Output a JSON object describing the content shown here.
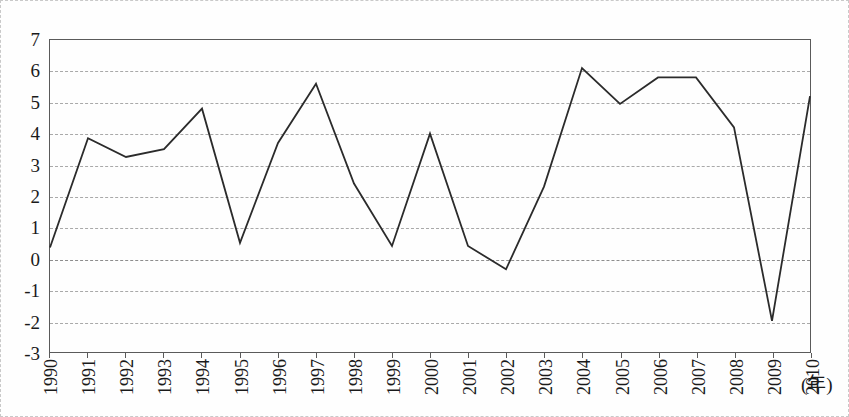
{
  "chart_data": {
    "type": "line",
    "title": "",
    "subtitle": "",
    "xlabel": "(年)",
    "ylabel": "",
    "categories": [
      "1990",
      "1991",
      "1992",
      "1993",
      "1994",
      "1995",
      "1996",
      "1997",
      "1998",
      "1999",
      "2000",
      "2001",
      "2002",
      "2003",
      "2004",
      "2005",
      "2006",
      "2007",
      "2008",
      "2009",
      "2010"
    ],
    "values": [
      0.35,
      3.85,
      3.25,
      3.5,
      4.8,
      0.5,
      3.7,
      5.6,
      2.4,
      0.4,
      4.0,
      0.4,
      -0.35,
      2.3,
      6.1,
      4.95,
      5.8,
      5.8,
      4.2,
      -2.0,
      5.2
    ],
    "series": [
      {
        "name": "",
        "values": [
          0.35,
          3.85,
          3.25,
          3.5,
          4.8,
          0.5,
          3.7,
          5.6,
          2.4,
          0.4,
          4.0,
          0.4,
          -0.35,
          2.3,
          6.1,
          4.95,
          5.8,
          5.8,
          4.2,
          -2.0,
          5.2
        ]
      }
    ],
    "ylim": [
      -3,
      7
    ],
    "yticks": [
      "7",
      "6",
      "5",
      "4",
      "3",
      "2",
      "1",
      "0",
      "-1",
      "-2",
      "-3"
    ],
    "ytick_values": [
      7,
      6,
      5,
      4,
      3,
      2,
      1,
      0,
      -1,
      -2,
      -3
    ],
    "xlim": [
      "1990",
      "2010"
    ],
    "grid": true,
    "grid_axis": "y",
    "legend": false,
    "legend_position": "none",
    "line_color": "#2b2b2b",
    "grid_color": "#a9a9a9",
    "axis_color": "#5a5a5a",
    "markers": false,
    "annotations": []
  },
  "axis": {
    "x_unit_label": "(年)"
  }
}
